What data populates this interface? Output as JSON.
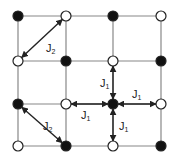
{
  "diagram": {
    "type": "square-lattice-exchange-couplings",
    "grid_x": [
      18,
      66,
      113,
      161
    ],
    "grid_y": [
      16,
      61,
      104,
      146
    ],
    "colors": {
      "line": "#888888",
      "filled": "#111111",
      "open_fill": "#ffffff",
      "stroke": "#222222",
      "arrow": "#222222"
    },
    "nodes": [
      {
        "row": 0,
        "col": 0,
        "state": "filled"
      },
      {
        "row": 0,
        "col": 1,
        "state": "open"
      },
      {
        "row": 0,
        "col": 2,
        "state": "filled"
      },
      {
        "row": 0,
        "col": 3,
        "state": "open"
      },
      {
        "row": 1,
        "col": 0,
        "state": "open"
      },
      {
        "row": 1,
        "col": 1,
        "state": "filled"
      },
      {
        "row": 1,
        "col": 2,
        "state": "open"
      },
      {
        "row": 1,
        "col": 3,
        "state": "filled"
      },
      {
        "row": 2,
        "col": 0,
        "state": "filled"
      },
      {
        "row": 2,
        "col": 1,
        "state": "open"
      },
      {
        "row": 2,
        "col": 2,
        "state": "filled"
      },
      {
        "row": 2,
        "col": 3,
        "state": "open"
      },
      {
        "row": 3,
        "col": 0,
        "state": "open"
      },
      {
        "row": 3,
        "col": 1,
        "state": "filled"
      },
      {
        "row": 3,
        "col": 2,
        "state": "open"
      },
      {
        "row": 3,
        "col": 3,
        "state": "filled"
      }
    ],
    "couplings": [
      {
        "from": [
          1,
          0
        ],
        "to": [
          0,
          1
        ],
        "label": "J",
        "sub": "2"
      },
      {
        "from": [
          2,
          0
        ],
        "to": [
          3,
          1
        ],
        "label": "J",
        "sub": "2"
      },
      {
        "from": [
          2,
          2
        ],
        "to": [
          1,
          2
        ],
        "label": "J",
        "sub": "1"
      },
      {
        "from": [
          2,
          2
        ],
        "to": [
          2,
          3
        ],
        "label": "J",
        "sub": "1"
      },
      {
        "from": [
          2,
          2
        ],
        "to": [
          2,
          1
        ],
        "label": "J",
        "sub": "1"
      },
      {
        "from": [
          2,
          2
        ],
        "to": [
          3,
          2
        ],
        "label": "J",
        "sub": "1"
      }
    ],
    "labels": [
      {
        "id": "j2-top",
        "main": "J",
        "sub": "2",
        "x": 46,
        "y": 43
      },
      {
        "id": "j2-bottom",
        "main": "J",
        "sub": "2",
        "x": 43,
        "y": 121
      },
      {
        "id": "j1-up",
        "main": "J",
        "sub": "1",
        "x": 100,
        "y": 78
      },
      {
        "id": "j1-right",
        "main": "J",
        "sub": "1",
        "x": 132,
        "y": 89
      },
      {
        "id": "j1-left",
        "main": "J",
        "sub": "1",
        "x": 81,
        "y": 110
      },
      {
        "id": "j1-down",
        "main": "J",
        "sub": "1",
        "x": 119,
        "y": 121
      }
    ]
  }
}
